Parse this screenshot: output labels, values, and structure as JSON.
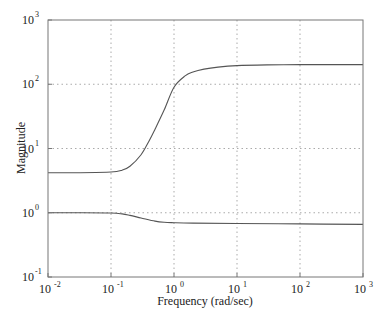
{
  "chart_data": {
    "type": "line",
    "title": "",
    "xlabel": "Frequency (rad/sec)",
    "ylabel": "Magnitude",
    "xscale": "log",
    "yscale": "log",
    "xlim": [
      0.01,
      1000
    ],
    "ylim": [
      0.1,
      1000
    ],
    "grid": true,
    "legend": null,
    "x_ticks": [
      {
        "base": "10",
        "exp": "-2",
        "value": 0.01
      },
      {
        "base": "10",
        "exp": "-1",
        "value": 0.1
      },
      {
        "base": "10",
        "exp": "0",
        "value": 1
      },
      {
        "base": "10",
        "exp": "1",
        "value": 10
      },
      {
        "base": "10",
        "exp": "2",
        "value": 100
      },
      {
        "base": "10",
        "exp": "3",
        "value": 1000
      }
    ],
    "y_ticks": [
      {
        "base": "10",
        "exp": "-1",
        "value": 0.1
      },
      {
        "base": "10",
        "exp": "0",
        "value": 1
      },
      {
        "base": "10",
        "exp": "1",
        "value": 10
      },
      {
        "base": "10",
        "exp": "2",
        "value": 100
      },
      {
        "base": "10",
        "exp": "3",
        "value": 1000
      }
    ],
    "series": [
      {
        "name": "upper",
        "x": [
          0.01,
          0.03,
          0.1,
          0.15,
          0.2,
          0.3,
          0.4,
          0.5,
          0.7,
          1.0,
          1.5,
          2,
          3,
          5,
          10,
          30,
          100,
          300,
          1000
        ],
        "y": [
          4.2,
          4.2,
          4.3,
          4.6,
          5.3,
          8.0,
          13,
          20,
          40,
          90,
          135,
          155,
          172,
          185,
          195,
          200,
          202,
          202,
          202
        ]
      },
      {
        "name": "lower",
        "x": [
          0.01,
          0.03,
          0.1,
          0.15,
          0.2,
          0.3,
          0.5,
          0.7,
          1.0,
          2,
          10,
          100,
          1000
        ],
        "y": [
          1.0,
          1.0,
          0.99,
          0.96,
          0.91,
          0.83,
          0.74,
          0.71,
          0.7,
          0.69,
          0.68,
          0.67,
          0.66
        ]
      }
    ]
  },
  "colors": {
    "line": "#555555",
    "axis": "#777777",
    "grid": "#aaaaaa"
  }
}
